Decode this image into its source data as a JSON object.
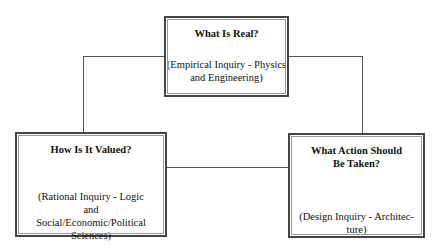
{
  "diagram": {
    "nodes": [
      {
        "id": "top",
        "title": "What Is Real?",
        "subtitle": "(Empirical Inquiry - Physics and Engineering)"
      },
      {
        "id": "left",
        "title": "How Is It Valued?",
        "subtitle": "(Rational Inquiry - Logic and Social/Economic/Political Sciences)"
      },
      {
        "id": "right",
        "title": "What Action Should Be Taken?",
        "subtitle": "(Design Inquiry - Architec-ture)"
      }
    ],
    "edges": [
      {
        "from": "top",
        "to": "left"
      },
      {
        "from": "top",
        "to": "right"
      },
      {
        "from": "left",
        "to": "right"
      }
    ]
  }
}
